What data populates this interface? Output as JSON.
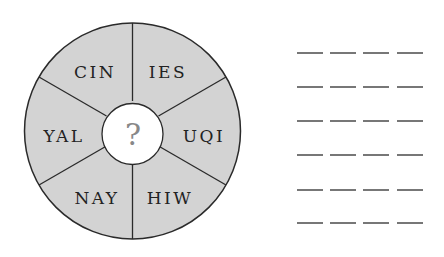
{
  "puzzle": {
    "segments": [
      {
        "label": "CIN",
        "x": 95,
        "y": 72
      },
      {
        "label": "IES",
        "x": 168,
        "y": 72
      },
      {
        "label": "UQI",
        "x": 203,
        "y": 136
      },
      {
        "label": "HIW",
        "x": 169,
        "y": 198
      },
      {
        "label": "NAY",
        "x": 96,
        "y": 198
      },
      {
        "label": "YAL",
        "x": 63,
        "y": 136
      }
    ],
    "center_symbol": "?",
    "answer_rows": 6,
    "letters_per_row": 4
  },
  "colors": {
    "segment_fill": "#d3d3d3",
    "center_fill": "#ffffff",
    "stroke": "#2a2a2a",
    "text": "#222222",
    "question_mark": "#888888",
    "dash": "#777777"
  }
}
